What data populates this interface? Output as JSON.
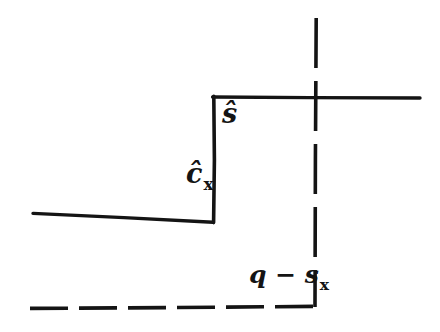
{
  "figure": {
    "type": "hand-drawn-line-diagram",
    "background_color": "#ffffff",
    "ink_color": "#141414",
    "labels": {
      "step_top": {
        "symbol": "ŝ",
        "subscript": ""
      },
      "step_left": {
        "symbol": "ĉ",
        "subscript": "x"
      },
      "bottom_right": {
        "symbol": "q − s",
        "subscript": "x"
      }
    },
    "strokes": [
      {
        "name": "lower-left-solid-segment",
        "style": "solid",
        "points": [
          [
            33,
            213
          ],
          [
            213,
            222
          ]
        ]
      },
      {
        "name": "step-riser-solid-segment",
        "style": "solid",
        "points": [
          [
            214,
            222
          ],
          [
            214,
            96
          ]
        ]
      },
      {
        "name": "upper-right-solid-segment",
        "style": "solid",
        "points": [
          [
            213,
            97
          ],
          [
            420,
            98
          ]
        ]
      },
      {
        "name": "vertical-dashed-axis",
        "style": "dashed",
        "points": [
          [
            316,
            18
          ],
          [
            315,
            307
          ]
        ]
      },
      {
        "name": "horizontal-dashed-axis",
        "style": "dashed",
        "points": [
          [
            30,
            308
          ],
          [
            315,
            306
          ]
        ]
      }
    ]
  }
}
